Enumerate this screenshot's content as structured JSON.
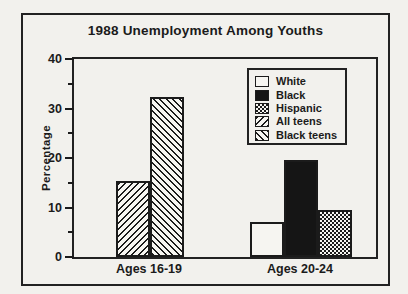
{
  "figure": {
    "background": "#f2f1ed",
    "ink": "#1b1b1b"
  },
  "chart_data": {
    "type": "bar",
    "title": "1988 Unemployment Among Youths",
    "xlabel": "",
    "ylabel": "Percentage",
    "ylim": [
      0,
      40
    ],
    "y_major_ticks": [
      0,
      10,
      20,
      30,
      40
    ],
    "y_minor_ticks": [
      5,
      15,
      25,
      35
    ],
    "grid": false,
    "legend_position": "upper right",
    "categories": [
      "Ages 16-19",
      "Ages 20-24"
    ],
    "legend": [
      {
        "name": "White",
        "pattern": "solid-white"
      },
      {
        "name": "Black",
        "pattern": "solid-black"
      },
      {
        "name": "Hispanic",
        "pattern": "checker"
      },
      {
        "name": "All teens",
        "pattern": "hatch-forward"
      },
      {
        "name": "Black teens",
        "pattern": "hatch-back"
      }
    ],
    "series": [
      {
        "name": "White",
        "pattern": "solid-white",
        "values": [
          null,
          7.0
        ]
      },
      {
        "name": "Black",
        "pattern": "solid-black",
        "values": [
          null,
          19.6
        ]
      },
      {
        "name": "Hispanic",
        "pattern": "checker",
        "values": [
          null,
          9.4
        ]
      },
      {
        "name": "All teens",
        "pattern": "hatch-forward",
        "values": [
          15.3,
          null
        ]
      },
      {
        "name": "Black teens",
        "pattern": "hatch-back",
        "values": [
          32.4,
          null
        ]
      }
    ]
  }
}
